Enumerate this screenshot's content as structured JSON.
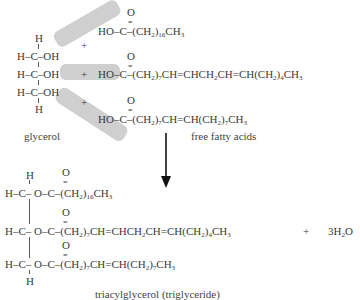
{
  "reaction": {
    "title": "Esterification of glycerol with fatty acids",
    "reactants": {
      "glycerol": {
        "label": "glycerol",
        "top_h": "H",
        "rows": [
          "H–C–OH",
          "H–C–OH",
          "H–C–OH"
        ],
        "bottom_h": "H"
      },
      "fatty_acids_label": "free fatty acids",
      "plus": "+",
      "acids": [
        {
          "carbonyl_o": "O",
          "double_bond": "=",
          "head": "HO–C–(CH",
          "sub1": "2",
          "mid": ")",
          "sub2": "16",
          "tail": "CH",
          "sub3": "3",
          "rest": ""
        },
        {
          "carbonyl_o": "O",
          "double_bond": "=",
          "head": "HO–C–(CH",
          "sub1": "2",
          "mid": ")",
          "sub2": "7",
          "tail": "CH=CHCH",
          "sub3": "2",
          "rest": "CH=CH(CH",
          "sub4": "2",
          "rest2": ")",
          "sub5": "4",
          "rest3": "CH",
          "sub6": "3"
        },
        {
          "carbonyl_o": "O",
          "double_bond": "=",
          "head": "HO–C–(CH",
          "sub1": "2",
          "mid": ")",
          "sub2": "7",
          "tail": "CH=CH(CH",
          "sub3": "2",
          "rest": ")",
          "sub4": "7",
          "rest2": "CH",
          "sub5": "3"
        }
      ]
    },
    "arrow": "down-arrow",
    "products": {
      "triglyceride_label": "triacylglycerol (triglyceride)",
      "top_h": "H",
      "bottom_h": "H",
      "ester_prefix": "H–C– O–C–(CH",
      "chains": [
        {
          "sub1": "2",
          "mid": ")",
          "sub2": "16",
          "tail": "CH",
          "sub3": "3"
        },
        {
          "sub1": "2",
          "mid": ")",
          "sub2": "7",
          "tail": "CH=CHCH",
          "sub3": "2",
          "rest": "CH=CH(CH",
          "sub4": "2",
          "rest2": ")",
          "sub5": "4",
          "rest3": "CH",
          "sub6": "3"
        },
        {
          "sub1": "2",
          "mid": ")",
          "sub2": "7",
          "tail": "CH=CH(CH",
          "sub3": "2",
          "rest": ")",
          "sub4": "7",
          "rest2": "CH",
          "sub5": "3"
        }
      ],
      "carbonyl_o": "O",
      "double_bond": "=",
      "plus": "+",
      "water": {
        "coef": "3H",
        "sub": "2",
        "tail": "O"
      }
    },
    "colors": {
      "text": "#3a3a3a",
      "band": "#cfcfcf",
      "arrow": "#111111"
    }
  }
}
